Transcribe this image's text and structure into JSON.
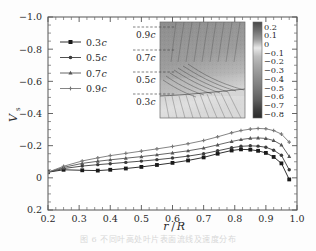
{
  "figure": {
    "caption": "图 6   不同叶高处叶片表面流线及速度分布"
  },
  "axes": {
    "ylabel": "Vs",
    "ylabel_main": "V",
    "ylabel_sub": "s",
    "xlabel": "r/R",
    "xlabel_num": "r",
    "xlabel_den": "R",
    "x_ticks": [
      "0.2",
      "0.3",
      "0.4",
      "0.5",
      "0.6",
      "0.7",
      "0.8",
      "0.9",
      "1.0"
    ],
    "y_ticks": [
      "-1.0",
      "-0.8",
      "-0.6",
      "-0.4",
      "-0.2",
      "0",
      "0.2"
    ],
    "xlim": [
      0.2,
      1.0
    ],
    "ylim_top": -1.0,
    "ylim_bottom": 0.2
  },
  "legend": {
    "items": [
      {
        "label": "0.3c",
        "num": "0.3",
        "sym": "c",
        "marker": "square",
        "color": "#1a1a1a"
      },
      {
        "label": "0.5c",
        "num": "0.5",
        "sym": "c",
        "marker": "circle",
        "color": "#3c3c3c"
      },
      {
        "label": "0.7c",
        "num": "0.7",
        "sym": "c",
        "marker": "triangle",
        "color": "#555555"
      },
      {
        "label": "0.9c",
        "num": "0.9",
        "sym": "c",
        "marker": "cross",
        "color": "#777777"
      }
    ]
  },
  "inset": {
    "section_labels": [
      "0.9c",
      "0.7c",
      "0.5c",
      "0.3c"
    ],
    "colorbar": {
      "ticks": [
        "0.2",
        "0.1",
        "0",
        "-0.1",
        "-0.2",
        "-0.3",
        "-0.4",
        "-0.5",
        "-0.6",
        "-0.7",
        "-0.8"
      ],
      "max": 0.2,
      "min": -0.8
    }
  },
  "chart_data": {
    "type": "line",
    "title": "",
    "xlabel": "r/R",
    "ylabel": "Vs",
    "xlim": [
      0.2,
      1.0
    ],
    "ylim": [
      0.2,
      -1.0
    ],
    "y_axis_inverted": true,
    "grid": false,
    "legend_position": "upper-left",
    "x": [
      0.2,
      0.25,
      0.31,
      0.36,
      0.4,
      0.45,
      0.5,
      0.55,
      0.6,
      0.65,
      0.7,
      0.745,
      0.79,
      0.82,
      0.85,
      0.875,
      0.9,
      0.925,
      0.95,
      0.975
    ],
    "series": [
      {
        "name": "0.3c",
        "marker": "square",
        "color": "#1a1a1a",
        "values": [
          -0.035,
          -0.05,
          -0.047,
          -0.045,
          -0.05,
          -0.058,
          -0.068,
          -0.08,
          -0.093,
          -0.108,
          -0.127,
          -0.15,
          -0.17,
          -0.177,
          -0.175,
          -0.168,
          -0.155,
          -0.13,
          -0.09,
          0.01
        ]
      },
      {
        "name": "0.5c",
        "marker": "circle",
        "color": "#3c3c3c",
        "values": [
          -0.035,
          -0.058,
          -0.073,
          -0.082,
          -0.088,
          -0.096,
          -0.104,
          -0.113,
          -0.123,
          -0.135,
          -0.15,
          -0.168,
          -0.187,
          -0.196,
          -0.199,
          -0.197,
          -0.19,
          -0.172,
          -0.14,
          -0.05
        ]
      },
      {
        "name": "0.7c",
        "marker": "triangle",
        "color": "#555555",
        "values": [
          -0.035,
          -0.065,
          -0.09,
          -0.103,
          -0.112,
          -0.122,
          -0.132,
          -0.143,
          -0.155,
          -0.168,
          -0.185,
          -0.205,
          -0.226,
          -0.238,
          -0.246,
          -0.248,
          -0.245,
          -0.232,
          -0.205,
          -0.133
        ]
      },
      {
        "name": "0.9c",
        "marker": "cross",
        "color": "#777777",
        "values": [
          -0.035,
          -0.072,
          -0.105,
          -0.124,
          -0.138,
          -0.152,
          -0.166,
          -0.18,
          -0.195,
          -0.212,
          -0.232,
          -0.255,
          -0.28,
          -0.294,
          -0.303,
          -0.307,
          -0.305,
          -0.294,
          -0.272,
          -0.222
        ]
      }
    ]
  }
}
